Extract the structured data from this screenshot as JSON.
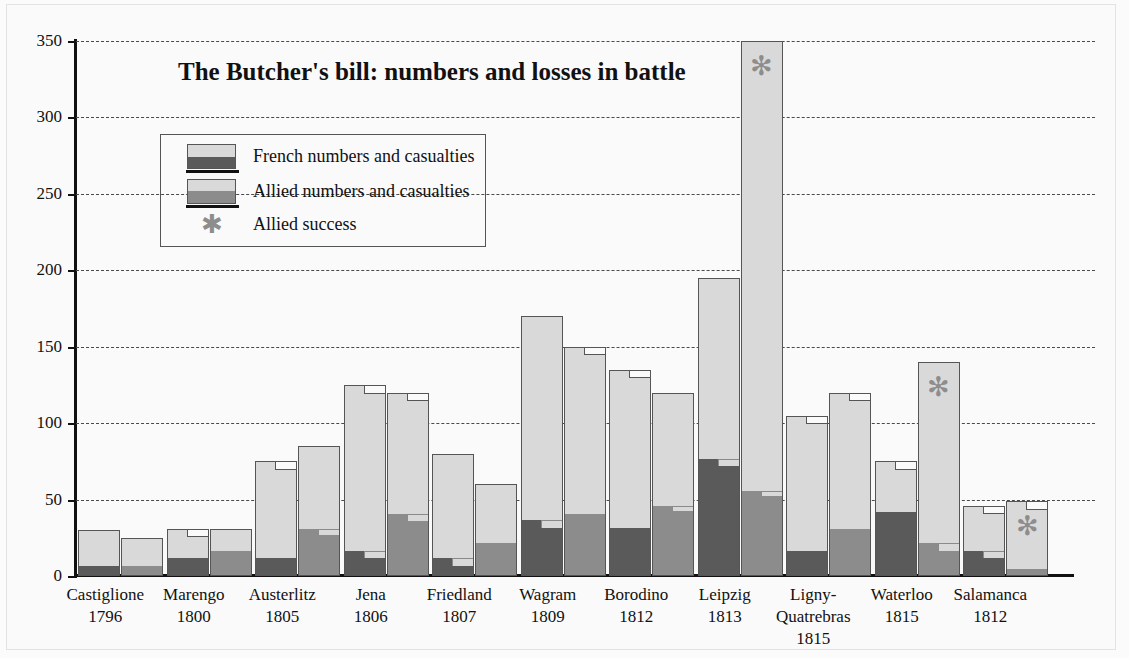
{
  "chart_data": {
    "type": "bar",
    "title": "The Butcher's bill:  numbers and losses in battle",
    "xlabel": "",
    "ylabel": "Thousands of men / casualties",
    "ylim": [
      0,
      350
    ],
    "yticks": [
      0,
      50,
      100,
      150,
      200,
      250,
      300,
      350
    ],
    "ytick_labels": [
      "0",
      "50",
      "100",
      "150",
      "200",
      "250",
      "300",
      "350"
    ],
    "grid": "horizontal-dashed",
    "legend_position": "upper-left-inside",
    "legend": [
      {
        "key": "french",
        "label": "French numbers and casualties"
      },
      {
        "key": "allied",
        "label": "Allied numbers and casualties"
      },
      {
        "key": "allied_success",
        "label": "Allied success"
      }
    ],
    "categories": [
      {
        "name": "Castiglione",
        "year": "1796"
      },
      {
        "name": "Marengo",
        "year": "1800"
      },
      {
        "name": "Austerlitz",
        "year": "1805"
      },
      {
        "name": "Jena",
        "year": "1806"
      },
      {
        "name": "Friedland",
        "year": "1807"
      },
      {
        "name": "Wagram",
        "year": "1809"
      },
      {
        "name": "Borodino",
        "year": "1812"
      },
      {
        "name": "Leipzig",
        "year": "1813"
      },
      {
        "name": "Ligny-\nQuatrebras",
        "year": "1815"
      },
      {
        "name": "Waterloo",
        "year": "1815"
      },
      {
        "name": "Salamanca",
        "year": "1812"
      }
    ],
    "series": [
      {
        "name": "French numbers and casualties",
        "numbers": [
          30,
          31,
          75,
          125,
          80,
          170,
          135,
          195,
          105,
          75,
          46
        ],
        "numbers_low": [
          30,
          26,
          70,
          120,
          80,
          170,
          130,
          195,
          100,
          70,
          41
        ],
        "casualties": [
          6,
          11,
          11,
          16,
          11,
          36,
          31,
          76,
          16,
          41,
          16
        ],
        "casualties_low": [
          6,
          11,
          11,
          11,
          6,
          31,
          31,
          71,
          16,
          41,
          11
        ]
      },
      {
        "name": "Allied numbers and casualties",
        "numbers": [
          25,
          31,
          85,
          120,
          60,
          150,
          120,
          350,
          120,
          140,
          49
        ],
        "numbers_low": [
          25,
          31,
          85,
          115,
          60,
          145,
          120,
          350,
          115,
          140,
          44
        ],
        "casualties": [
          6,
          16,
          30,
          40,
          21,
          40,
          45,
          55,
          30,
          21,
          4
        ],
        "casualties_low": [
          6,
          16,
          26,
          35,
          21,
          40,
          42,
          52,
          30,
          16,
          4
        ]
      }
    ],
    "allied_success": [
      "Leipzig",
      "Waterloo",
      "Salamanca"
    ],
    "colors": {
      "bar_fill": "#d9d9d9",
      "french_casualty": "#5a5a5a",
      "allied_casualty": "#8c8c8c",
      "bar_outline": "#555555",
      "gridline": "#4a4a4a",
      "axis": "#111111",
      "star": "#8d8d8d",
      "background": "#fafafa"
    }
  }
}
